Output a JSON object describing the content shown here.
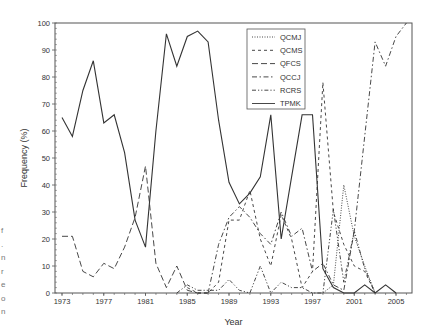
{
  "chart_data": {
    "type": "line",
    "title": "",
    "xlabel": "Year",
    "ylabel": "Frequency (%)",
    "xlim": [
      1972.3,
      2006.5
    ],
    "ylim": [
      0,
      100
    ],
    "x_ticks": [
      1973,
      1977,
      1981,
      1985,
      1989,
      1993,
      1997,
      2001,
      2005
    ],
    "y_ticks": [
      0,
      10,
      20,
      30,
      40,
      50,
      60,
      70,
      80,
      90,
      100
    ],
    "grid": false,
    "legend_position": "upper center-right",
    "series": [
      {
        "name": "QCMJ",
        "style": "dotted",
        "x": [
          1998,
          1999,
          2000,
          2001,
          2002,
          2003
        ],
        "values": [
          0,
          3,
          40,
          21,
          10,
          0
        ]
      },
      {
        "name": "QCMS",
        "style": "short-dash",
        "x": [
          1985,
          1986,
          1987,
          1988,
          1989,
          1990,
          1991,
          1992,
          1993,
          1994,
          1995,
          1996,
          1997,
          1998,
          1999,
          2000,
          2001,
          2002,
          2003
        ],
        "values": [
          2,
          0,
          0,
          4,
          27,
          27,
          38,
          20,
          10,
          29,
          20,
          2,
          8,
          78,
          30,
          18,
          10,
          8,
          0
        ]
      },
      {
        "name": "QFCS",
        "style": "long-dash",
        "x": [
          1973,
          1974,
          1975,
          1976,
          1977,
          1978,
          1979,
          1980,
          1981,
          1982,
          1983,
          1984,
          1985,
          1986,
          1987
        ],
        "values": [
          21,
          21,
          8,
          6,
          11,
          9,
          17,
          28,
          47,
          11,
          2,
          10,
          1,
          0,
          0
        ]
      },
      {
        "name": "QCCJ",
        "style": "dash-dot",
        "x": [
          1987,
          1988,
          1989,
          1990,
          1991,
          1992,
          1993,
          1994,
          1995,
          1996,
          1997,
          1998,
          1999,
          2000,
          2001,
          2002,
          2003,
          2004,
          2005,
          2006
        ],
        "values": [
          0,
          18,
          28,
          32,
          28,
          22,
          18,
          30,
          21,
          24,
          8,
          11,
          3,
          1,
          23,
          58,
          93,
          84,
          95,
          100
        ]
      },
      {
        "name": "RCRS",
        "style": "dash-dot-dot",
        "x": [
          1984,
          1985,
          1986,
          1987,
          1988,
          1989,
          1990,
          1991,
          1992,
          1993,
          1994,
          1995,
          1996,
          1997,
          1998,
          1999,
          2000,
          2001,
          2002,
          2003
        ],
        "values": [
          0,
          3,
          1,
          1,
          1,
          5,
          1,
          0,
          10,
          0,
          4,
          2,
          2,
          0,
          0,
          31,
          4,
          23,
          9,
          0
        ]
      },
      {
        "name": "TPMK",
        "style": "solid",
        "x": [
          1973,
          1974,
          1975,
          1976,
          1977,
          1978,
          1979,
          1980,
          1981,
          1982,
          1983,
          1984,
          1985,
          1986,
          1987,
          1988,
          1989,
          1990,
          1991,
          1992,
          1993,
          1994,
          1995,
          1996,
          1997,
          1998,
          1999,
          2000,
          2001,
          2002,
          2003,
          2004,
          2005
        ],
        "values": [
          65,
          58,
          75,
          86,
          63,
          66,
          52,
          27,
          17,
          60,
          96,
          84,
          95,
          97,
          93,
          64,
          41,
          33,
          37,
          43,
          66,
          20,
          43,
          66,
          66,
          9,
          2,
          0,
          0,
          3,
          0,
          3,
          0
        ]
      }
    ]
  },
  "side_text_fragments": [
    "f",
    ".",
    "n",
    "r",
    "e",
    "o",
    "n"
  ],
  "colors": {
    "line": "#333333",
    "axis": "#555555",
    "background": "#ffffff"
  }
}
